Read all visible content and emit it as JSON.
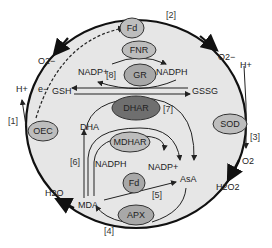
{
  "diagram": {
    "type": "metabolic-pathway",
    "enzymes": [
      {
        "id": "fd_top",
        "label": "Fd"
      },
      {
        "id": "fnr",
        "label": "FNR"
      },
      {
        "id": "gr",
        "label": "GR"
      },
      {
        "id": "dhar",
        "label": "DHAR"
      },
      {
        "id": "oec",
        "label": "OEC"
      },
      {
        "id": "sod",
        "label": "SOD"
      },
      {
        "id": "mdhar",
        "label": "MDHAR"
      },
      {
        "id": "fd_bottom",
        "label": "Fd"
      },
      {
        "id": "apx",
        "label": "APX"
      }
    ],
    "metabolites": {
      "o2_superoxide": "O2−",
      "o2_left": "O2",
      "h_plus_left": "H+",
      "electron": "e−",
      "nadp_top": "NADP+",
      "nadph_top": "NADPH",
      "gsh": "GSH",
      "gssg": "GSSG",
      "h_plus_right": "H+",
      "o2_right": "O2",
      "h2o2": "H2O2",
      "dha": "DHA",
      "nadph_mid": "NADPH",
      "nadp_mid": "NADP+",
      "asa": "AsA",
      "mda": "MDA",
      "h2o": "H2O"
    },
    "reaction_numbers": [
      "[1]",
      "[2]",
      "[3]",
      "[4]",
      "[5]",
      "[6]",
      "[7]",
      "[8]"
    ],
    "colors": {
      "cell_fill": "#e6e6e6",
      "outline": "#111111",
      "enzyme_light": "#bdbdbd",
      "enzyme_dark": "#6f6f6f"
    }
  }
}
